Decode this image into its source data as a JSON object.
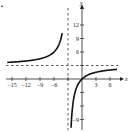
{
  "part_label": "•",
  "chart_data": {
    "type": "line",
    "title": "",
    "function": "f(x) = 3x/(x+3)",
    "xlabel": "x",
    "ylabel": "y",
    "xlim": [
      -16,
      8
    ],
    "ylim": [
      -10,
      15
    ],
    "x_ticks": [
      -15,
      -12,
      -9,
      -6,
      -3,
      3,
      6
    ],
    "x_tick_labels": [
      "−15",
      "−12",
      "−9",
      "−6",
      "3",
      "6"
    ],
    "y_ticks": [
      -9,
      -6,
      -3,
      3,
      6,
      9,
      12
    ],
    "y_tick_labels": [
      "12",
      "9",
      "6",
      "−9"
    ],
    "asymptotes": {
      "vertical": -3,
      "horizontal": 3
    },
    "grid": false,
    "series": [
      {
        "name": "left branch",
        "x": [
          -16,
          -15,
          -12,
          -9,
          -7,
          -6,
          -5,
          -4.5,
          -4.2
        ],
        "y": [
          3.69,
          3.75,
          4.0,
          4.5,
          5.25,
          6.0,
          7.5,
          9.0,
          10.5
        ]
      },
      {
        "name": "right branch",
        "x": [
          -2.4,
          -2,
          -1.5,
          -1,
          0,
          1,
          3,
          6,
          7.5
        ],
        "y": [
          -12.0,
          -6.0,
          -3.0,
          -1.5,
          0,
          0.75,
          1.5,
          2.0,
          2.14
        ]
      }
    ]
  }
}
